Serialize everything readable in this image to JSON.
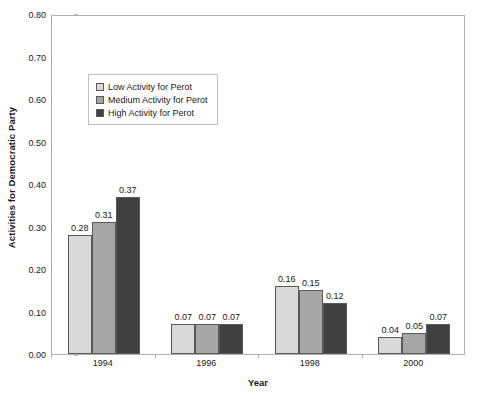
{
  "chart_data": {
    "type": "bar",
    "title": "",
    "xlabel": "Year",
    "ylabel": "Activities for Democratic Party",
    "categories": [
      "1994",
      "1996",
      "1998",
      "2000"
    ],
    "ylim": [
      0.0,
      0.8
    ],
    "ytick_step": 0.1,
    "ytick_labels": [
      "0.80",
      "0.70",
      "0.60",
      "0.50",
      "0.40",
      "0.30",
      "0.20",
      "0.10",
      "0.00"
    ],
    "ytick_values": [
      0.8,
      0.7,
      0.6,
      0.5,
      0.4,
      0.3,
      0.2,
      0.1,
      0.0
    ],
    "grid": false,
    "legend_position": "upper-left-inside",
    "series": [
      {
        "name": "Low Activity for Perot",
        "color": "#d9d9d9",
        "values": [
          0.28,
          0.07,
          0.16,
          0.04
        ],
        "labels": [
          "0.28",
          "0.07",
          "0.16",
          "0.04"
        ]
      },
      {
        "name": "Medium Activity for Perot",
        "color": "#a6a6a6",
        "values": [
          0.31,
          0.07,
          0.15,
          0.05
        ],
        "labels": [
          "0.31",
          "0.07",
          "0.15",
          "0.05"
        ]
      },
      {
        "name": "High Activity for Perot",
        "color": "#404040",
        "values": [
          0.37,
          0.07,
          0.12,
          0.07
        ],
        "labels": [
          "0.37",
          "0.07",
          "0.12",
          "0.07"
        ]
      }
    ]
  },
  "style": {
    "bar_border_color": "#595959",
    "plot_border_color": "#b0b0b0",
    "text_color": "#1a1a1a",
    "background": "#ffffff"
  }
}
